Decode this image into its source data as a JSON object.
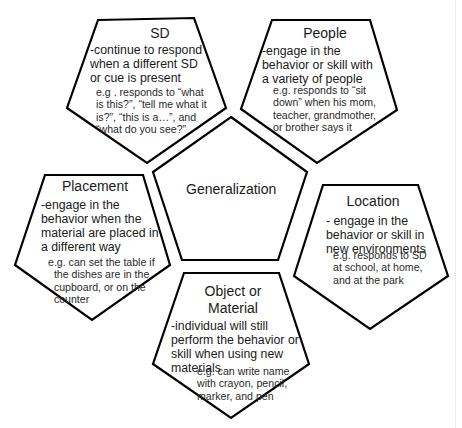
{
  "diagram": {
    "center": {
      "label": "Generalization"
    },
    "nodes": {
      "sd": {
        "title": "SD",
        "description": "-continue to respond\nwhen a different SD\nor cue is present",
        "example": "e.g . responds to “what\nis this?”, “tell me what it\nis?”, “this is a…”, and\n“what do you see?”"
      },
      "people": {
        "title": "People",
        "description": "-engage in the\nbehavior or skill with\na variety of people",
        "example": "e.g. responds to “sit\ndown” when his mom,\nteacher, grandmother,\nor brother says it"
      },
      "placement": {
        "title": "Placement",
        "description": "-engage in the\nbehavior when the\nmaterial are placed in\na different way",
        "example": "e.g. can set the table if\n  the dishes are in the\n  cupboard, or on the\n  counter"
      },
      "location": {
        "title": "Location",
        "description": "- engage in the\nbehavior or skill in\nnew environments",
        "example": "e.g. responds to SD\nat school, at home,\nand at the park"
      },
      "object_material": {
        "title": "Object or\nMaterial",
        "description": "-individual will still\nperform the behavior or\nskill when using new\nmaterials",
        "example": "e.g. can write name\nwith crayon, pencil,\nmarker, and pen"
      }
    },
    "colors": {
      "stroke": "#000000",
      "fill": "#ffffff",
      "text": "#1a1a1a"
    }
  }
}
